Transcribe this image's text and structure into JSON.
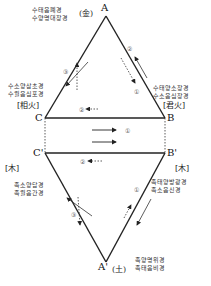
{
  "points": {
    "A": "A",
    "B": "B",
    "C": "C",
    "B_prime": "B'",
    "C_prime": "C'",
    "A_prime": "A'"
  },
  "elements": {
    "metal": "(金)",
    "sovereign_fire": "[君火]",
    "minister_fire": "[相火]",
    "wood_left": "[木]",
    "wood_right": "[木]",
    "earth": "(土)"
  },
  "meridians": {
    "top": [
      "수태음폐경",
      "수양명대장경"
    ],
    "left": [
      "수소양삼초경",
      "수궐음심포경"
    ],
    "right": [
      "수태양소장경",
      "수소음심장경"
    ],
    "lower_left": [
      "족소양담경",
      "족궐음간경"
    ],
    "lower_right": [
      "족태양방광경",
      "족소음신경"
    ],
    "bottom": [
      "족양명위경",
      "족태음비경"
    ]
  },
  "step_markers": {
    "upper_right_1": "①",
    "upper_right_2": "②",
    "upper_left_3": "③",
    "middle_top_2": "②",
    "middle_bottom_2": "②",
    "middle_1": "①",
    "lower_left_3": "③",
    "lower_right_1": "①"
  }
}
